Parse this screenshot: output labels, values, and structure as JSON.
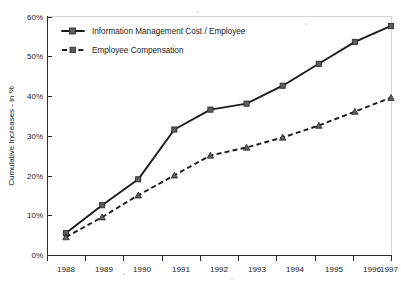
{
  "chart_data": {
    "type": "line",
    "title": "",
    "subtitle": "",
    "xlabel": "",
    "ylabel": "Cumulative Increases - in %",
    "categories": [
      "1988",
      "1989",
      "1990",
      "1991",
      "1992",
      "1993",
      "1994",
      "1995",
      "1996",
      "1997"
    ],
    "x": [
      1988,
      1989,
      1990,
      1991,
      1992,
      1993,
      1994,
      1995,
      1996,
      1997
    ],
    "xlim": [
      1988,
      1997
    ],
    "ylim": [
      0,
      60
    ],
    "y_ticks": [
      0,
      10,
      20,
      30,
      40,
      50,
      60
    ],
    "y_tick_labels": [
      "0%",
      "10%",
      "20%",
      "30%",
      "40%",
      "50%",
      "60%"
    ],
    "x_tick_labels": [
      "1988",
      "1989",
      "1990",
      "1991",
      "1992",
      "1993",
      "1994",
      "1995",
      "1996",
      "1997"
    ],
    "grid": false,
    "legend_position": "upper-left-inside",
    "series": [
      {
        "name": "Information Management Cost / Employee",
        "style": "solid",
        "marker": "square",
        "color": "#1c1c1c",
        "values": [
          5.5,
          12.5,
          19.0,
          31.5,
          36.5,
          38.0,
          42.5,
          48.0,
          53.5,
          57.5
        ]
      },
      {
        "name": "Employee Compensation",
        "style": "dashed",
        "marker": "triangle",
        "color": "#1c1c1c",
        "values": [
          4.5,
          9.5,
          15.0,
          20.0,
          25.0,
          27.0,
          29.5,
          32.5,
          36.0,
          39.5
        ]
      }
    ],
    "annotations": []
  },
  "axis": {
    "y_title": "Cumulative Increases - in %",
    "y_labels": [
      "60%",
      "50%",
      "40%",
      "30%",
      "20%",
      "10%",
      "0%"
    ],
    "x_labels": [
      "1988",
      "1989",
      "1990",
      "1991",
      "1992",
      "1993",
      "1994",
      "1995",
      "1996",
      "1997"
    ]
  },
  "legend": {
    "entries": [
      {
        "label": "Information Management Cost / Employee"
      },
      {
        "label": "Employee Compensation"
      }
    ]
  }
}
